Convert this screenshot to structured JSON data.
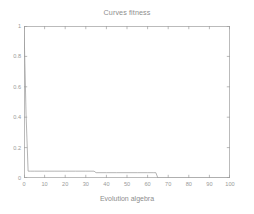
{
  "chart_data": {
    "type": "line",
    "title": "Curves fitness",
    "xlabel": "Evolution algebra",
    "ylabel": "",
    "xlim": [
      0,
      100
    ],
    "ylim": [
      0,
      1
    ],
    "grid": false,
    "legend": null,
    "x_ticks": [
      0,
      10,
      20,
      30,
      40,
      50,
      60,
      70,
      80,
      90,
      100
    ],
    "x_tick_labels": [
      "0",
      "10",
      "20",
      "30",
      "40",
      "50",
      "60",
      "70",
      "80",
      "90",
      "100"
    ],
    "y_ticks": [
      0,
      0.2,
      0.4,
      0.6,
      0.8,
      1
    ],
    "y_tick_labels": [
      "0",
      "0.2",
      "0.4",
      "0.6",
      "0.8",
      "1"
    ],
    "series": [
      {
        "name": "fitness",
        "color": "#9b9b9b",
        "x": [
          0,
          1,
          2,
          3,
          5,
          10,
          15,
          20,
          25,
          30,
          34,
          35,
          40,
          45,
          50,
          55,
          60,
          63,
          64,
          65,
          70,
          80,
          90,
          100
        ],
        "values": [
          1,
          0.42,
          0.045,
          0.045,
          0.045,
          0.045,
          0.045,
          0.045,
          0.045,
          0.045,
          0.045,
          0.035,
          0.035,
          0.035,
          0.035,
          0.035,
          0.035,
          0.035,
          0.035,
          0,
          0,
          0,
          0,
          0
        ]
      }
    ],
    "annotations": [
      "Curve starts at fitness 1 at generation 0",
      "Steep drop to a low plateau near 0.045 by generation 2",
      "Small step down to about 0.035 near generation 35",
      "Drops to 0 at about generation 64 and stays at 0"
    ]
  },
  "axes": {
    "box_style": "four-sided box with inward tick marks",
    "axis_color": "#9e9e9e",
    "background": "#ffffff"
  }
}
